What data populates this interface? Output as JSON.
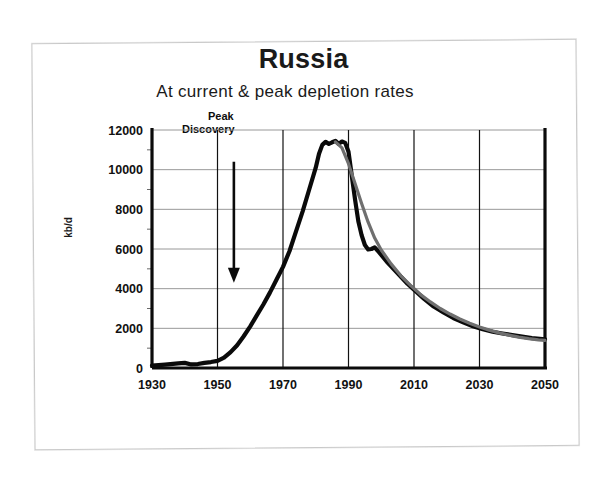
{
  "slide": {
    "title": "Russia",
    "subtitle": "At current & peak depletion rates"
  },
  "annotation": {
    "line1": "Peak",
    "line2": "Discovery",
    "icon": "down-arrow-icon"
  },
  "chart_data": {
    "type": "line",
    "title": "Russia",
    "subtitle": "At current & peak depletion rates",
    "xlabel": "",
    "ylabel": "kb/d",
    "xlim": [
      1930,
      2050
    ],
    "ylim": [
      0,
      12000
    ],
    "xticks": [
      1930,
      1950,
      1970,
      1990,
      2010,
      2030,
      2050
    ],
    "yticks": [
      0,
      2000,
      4000,
      6000,
      8000,
      10000,
      12000
    ],
    "ytick_labels": [
      "0",
      "2000",
      "4000",
      "6000",
      "8000",
      "10000",
      "12000"
    ],
    "xtick_labels": [
      "1930",
      "1950",
      "1970",
      "1990",
      "2010",
      "2030",
      "2050"
    ],
    "y_minor_step": 1000,
    "grid": "both",
    "legend": "none",
    "annotations": [
      {
        "text": "Peak Discovery",
        "x": 1955,
        "y_from": 10400,
        "y_to": 4500,
        "style": "down-arrow"
      }
    ],
    "series": [
      {
        "name": "Current depletion rate",
        "color": "#0a0a0a",
        "x": [
          1930,
          1934,
          1938,
          1940,
          1942,
          1944,
          1946,
          1948,
          1950,
          1952,
          1954,
          1956,
          1958,
          1960,
          1962,
          1964,
          1966,
          1968,
          1970,
          1972,
          1974,
          1976,
          1978,
          1980,
          1981,
          1982,
          1983,
          1984,
          1985,
          1986,
          1987,
          1988,
          1989,
          1990,
          1991,
          1992,
          1993,
          1994,
          1995,
          1996,
          1997,
          1998,
          1999,
          2000,
          2002,
          2004,
          2006,
          2008,
          2010,
          2013,
          2016,
          2019,
          2022,
          2025,
          2028,
          2031,
          2034,
          2037,
          2040,
          2043,
          2046,
          2050
        ],
        "y": [
          120,
          170,
          230,
          260,
          180,
          200,
          260,
          300,
          360,
          520,
          800,
          1150,
          1600,
          2100,
          2650,
          3200,
          3800,
          4450,
          5100,
          5900,
          6900,
          7900,
          9000,
          10100,
          10800,
          11250,
          11400,
          11300,
          11380,
          11450,
          11300,
          11420,
          11350,
          10900,
          9700,
          8500,
          7400,
          6700,
          6200,
          5980,
          6000,
          6080,
          5900,
          5700,
          5300,
          4950,
          4600,
          4250,
          3950,
          3500,
          3100,
          2800,
          2520,
          2300,
          2100,
          1950,
          1830,
          1740,
          1660,
          1580,
          1510,
          1450
        ]
      },
      {
        "name": "Peak depletion rate",
        "color": "#6f6f6f",
        "x": [
          1986,
          1988,
          1990,
          1992,
          1994,
          1996,
          1998,
          2000,
          2003,
          2006,
          2009,
          2012,
          2015,
          2018,
          2021,
          2024,
          2027,
          2030,
          2033,
          2036,
          2039,
          2042,
          2045,
          2048,
          2050
        ],
        "y": [
          11400,
          11100,
          10300,
          9300,
          8300,
          7350,
          6550,
          5950,
          5250,
          4650,
          4150,
          3700,
          3330,
          3000,
          2720,
          2470,
          2260,
          2070,
          1910,
          1770,
          1660,
          1560,
          1480,
          1420,
          1390
        ]
      }
    ]
  },
  "geometry": {
    "plot_left_px": 152,
    "plot_right_px": 545,
    "plot_top_px": 130,
    "plot_bottom_px": 368
  }
}
